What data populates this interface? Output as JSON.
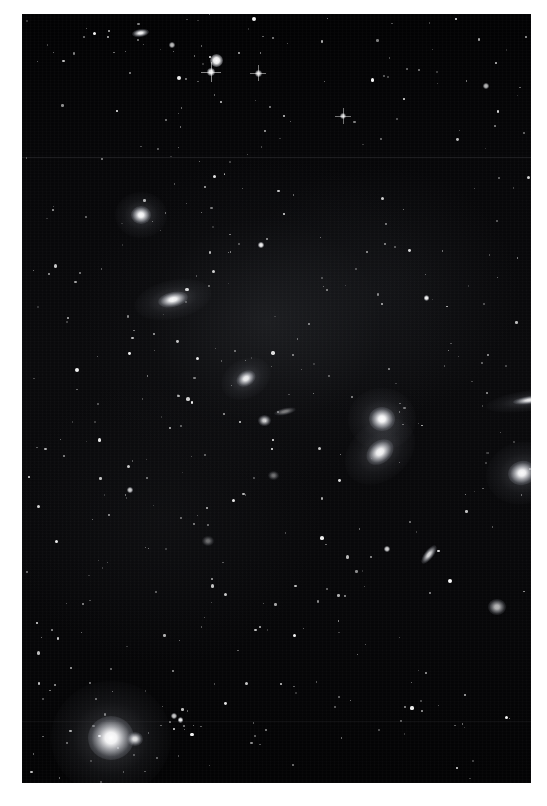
{
  "page": {
    "background_color": "#ffffff",
    "image_type": "astronomical-photograph",
    "caption": ""
  },
  "plate": {
    "name": "deep-sky-star-field",
    "x": 22,
    "y": 14,
    "width": 509,
    "height": 769,
    "background_color": "#000000",
    "sky_tint": "#0a0a0c",
    "description": "Deep-sky photographic plate of a galaxy cluster field with numerous foreground stars"
  },
  "chart_data": {
    "type": "scatter",
    "title": "",
    "xlabel": "",
    "ylabel": "",
    "xlim": [
      0,
      509
    ],
    "ylim": [
      0,
      769
    ],
    "grid": false,
    "legend": null,
    "note": "Positions are plate-relative pixels; size = apparent diameter; brightness 0-1",
    "galaxies": [
      {
        "id": "G1",
        "x": 110,
        "y": 15,
        "w": 17,
        "h": 8,
        "angle": -8,
        "brightness": 0.96,
        "kind": "lenticular"
      },
      {
        "id": "G2",
        "x": 109,
        "y": 192,
        "w": 20,
        "h": 18,
        "angle": 0,
        "brightness": 0.98,
        "kind": "elliptical"
      },
      {
        "id": "G3",
        "x": 136,
        "y": 278,
        "w": 30,
        "h": 15,
        "angle": -12,
        "brightness": 0.97,
        "kind": "lenticular"
      },
      {
        "id": "G4",
        "x": 214,
        "y": 357,
        "w": 20,
        "h": 15,
        "angle": -30,
        "brightness": 0.92,
        "kind": "elliptical"
      },
      {
        "id": "G5",
        "x": 236,
        "y": 401,
        "w": 13,
        "h": 11,
        "angle": 0,
        "brightness": 0.8,
        "kind": "dwarf"
      },
      {
        "id": "G6",
        "x": 252,
        "y": 394,
        "w": 22,
        "h": 7,
        "angle": -12,
        "brightness": 0.45,
        "kind": "edge-on-spiral"
      },
      {
        "id": "G7",
        "x": 347,
        "y": 393,
        "w": 26,
        "h": 24,
        "angle": 0,
        "brightness": 1.0,
        "kind": "elliptical"
      },
      {
        "id": "G8",
        "x": 343,
        "y": 427,
        "w": 30,
        "h": 22,
        "angle": -40,
        "brightness": 0.96,
        "kind": "lenticular"
      },
      {
        "id": "G9",
        "x": 491,
        "y": 382,
        "w": 34,
        "h": 8,
        "angle": -8,
        "brightness": 0.9,
        "kind": "edge-on-spiral"
      },
      {
        "id": "G10",
        "x": 486,
        "y": 447,
        "w": 28,
        "h": 24,
        "angle": -15,
        "brightness": 0.98,
        "kind": "elliptical"
      },
      {
        "id": "G11",
        "x": 396,
        "y": 536,
        "w": 22,
        "h": 9,
        "angle": -52,
        "brightness": 0.85,
        "kind": "inclined-spiral"
      },
      {
        "id": "G12",
        "x": 466,
        "y": 585,
        "w": 18,
        "h": 16,
        "angle": 0,
        "brightness": 0.7,
        "kind": "elliptical"
      },
      {
        "id": "G13",
        "x": 66,
        "y": 702,
        "w": 46,
        "h": 44,
        "angle": 0,
        "brightness": 1.0,
        "kind": "bright-star-or-nucleus"
      },
      {
        "id": "G14",
        "x": 105,
        "y": 718,
        "w": 16,
        "h": 14,
        "angle": 0,
        "brightness": 0.88,
        "kind": "elliptical"
      },
      {
        "id": "G15",
        "x": 246,
        "y": 457,
        "w": 11,
        "h": 9,
        "angle": 0,
        "brightness": 0.42,
        "kind": "dwarf"
      },
      {
        "id": "G16",
        "x": 180,
        "y": 522,
        "w": 12,
        "h": 10,
        "angle": 0,
        "brightness": 0.4,
        "kind": "dwarf"
      }
    ],
    "bright_stars": [
      {
        "id": "S1",
        "x": 194,
        "y": 46,
        "r": 6.5,
        "brightness": 1.0
      },
      {
        "id": "S2",
        "x": 189,
        "y": 58,
        "r": 4.0,
        "brightness": 0.95,
        "spikes": true
      },
      {
        "id": "S3",
        "x": 236,
        "y": 59,
        "r": 3.5,
        "brightness": 0.85,
        "spikes": true
      },
      {
        "id": "S4",
        "x": 321,
        "y": 102,
        "r": 3.2,
        "brightness": 0.8,
        "spikes": true
      },
      {
        "id": "S5",
        "x": 150,
        "y": 31,
        "r": 3.0,
        "brightness": 0.75
      },
      {
        "id": "S6",
        "x": 464,
        "y": 72,
        "r": 2.8,
        "brightness": 0.72
      },
      {
        "id": "S7",
        "x": 108,
        "y": 476,
        "r": 3.4,
        "brightness": 0.82
      },
      {
        "id": "S8",
        "x": 365,
        "y": 535,
        "r": 3.4,
        "brightness": 0.84
      },
      {
        "id": "S9",
        "x": 152,
        "y": 702,
        "r": 3.2,
        "brightness": 0.8
      }
    ],
    "star_count_estimate": 480
  },
  "annotations": {
    "border_present": true,
    "border_color": "#ffffff",
    "visible_text": ""
  }
}
